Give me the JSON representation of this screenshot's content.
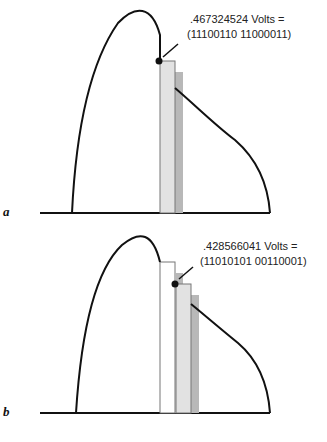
{
  "panels": [
    {
      "id": "a",
      "letter": "a",
      "annotation_line1": ".467324524 Volts =",
      "annotation_line2": "(11100110 11000011)"
    },
    {
      "id": "b",
      "letter": "b",
      "annotation_line1": ".428566041 Volts =",
      "annotation_line2": "(11010101 00110001)"
    }
  ],
  "colors": {
    "curve": "#111111",
    "sample_bar_light": "#e2e2e2",
    "sample_bar_shadow": "#b8b8b8",
    "previous_bar": "#ffffff"
  }
}
